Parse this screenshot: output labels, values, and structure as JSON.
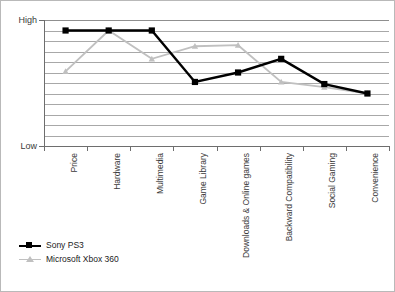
{
  "chart_data": {
    "type": "line",
    "title": "",
    "subtitle": "",
    "xlabel": "",
    "ylabel": "",
    "categories": [
      "Price",
      "Hardware",
      "Multimedia",
      "Game Library",
      "Downloads & Online games",
      "Backward Compatibility",
      "Social Gaming",
      "Convenience"
    ],
    "ytick_labels": [
      "High",
      "Low"
    ],
    "ylim": [
      0,
      12
    ],
    "ylim_labels": {
      "min": "Low",
      "max": "High"
    },
    "grid": true,
    "gridlines": 12,
    "legend_position": "bottom-left",
    "series": [
      {
        "name": "Sony PS3",
        "color": "#000000",
        "marker": "square",
        "values": [
          11.0,
          11.0,
          11.0,
          6.1,
          7.0,
          8.3,
          5.9,
          5.0
        ]
      },
      {
        "name": "Microsoft Xbox 360",
        "color": "#c0c0c0",
        "marker": "triangle",
        "values": [
          7.1,
          11.0,
          8.3,
          9.5,
          9.6,
          6.1,
          5.6,
          5.0
        ]
      }
    ]
  },
  "axis": {
    "high_label": "High",
    "low_label": "Low"
  },
  "legend": {
    "items": [
      {
        "label": "Sony PS3",
        "color": "#000000",
        "marker": "square"
      },
      {
        "label": "Microsoft Xbox 360",
        "color": "#c0c0c0",
        "marker": "triangle"
      }
    ]
  }
}
